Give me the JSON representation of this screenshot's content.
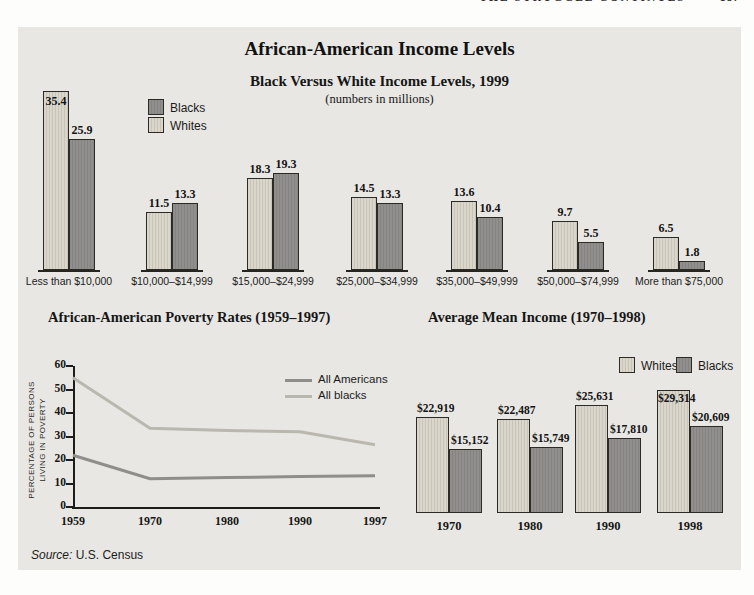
{
  "page": {
    "running_header": "THE STRUGGLE CONTINUES",
    "running_page": "187"
  },
  "panel": {
    "title": "African-American Income Levels",
    "source_label": "Source:",
    "source_text": "U.S. Census",
    "background": "#e8e7e3"
  },
  "colors": {
    "whites_bar": "#d5d1c7",
    "whites_bar_stripe": "#c8c4b8",
    "blacks_bar": "#8c8b89",
    "bar_border": "#2b2a24",
    "line_all_americans": "#8f8e8a",
    "line_all_blacks": "#bab7ae"
  },
  "chart_data": [
    {
      "type": "bar",
      "title": "Black Versus White Income Levels, 1999",
      "subtitle": "(numbers in millions)",
      "categories": [
        "Less than $10,000",
        "$10,000–$14,999",
        "$15,000–$24,999",
        "$25,000–$34,999",
        "$35,000–$49,999",
        "$50,000–$74,999",
        "More than $75,000"
      ],
      "series": [
        {
          "name": "Whites",
          "values": [
            35.4,
            11.5,
            18.3,
            14.5,
            13.6,
            9.7,
            6.5
          ]
        },
        {
          "name": "Blacks",
          "values": [
            25.9,
            13.3,
            19.3,
            13.3,
            10.4,
            5.5,
            1.8
          ]
        }
      ],
      "legend_order": [
        "Blacks",
        "Whites"
      ],
      "legend_position": "upper-left"
    },
    {
      "type": "line",
      "title": "African-American Poverty Rates (1959–1997)",
      "x": [
        "1959",
        "1970",
        "1980",
        "1990",
        "1997"
      ],
      "series": [
        {
          "name": "All Americans",
          "values": [
            22,
            12,
            12.5,
            13,
            13.3
          ]
        },
        {
          "name": "All blacks",
          "values": [
            55,
            33.5,
            32.5,
            32,
            26.5
          ]
        }
      ],
      "ylabel_line1": "PERCENTAGE OF PERSONS",
      "ylabel_line2": "LIVING IN POVERTY",
      "yticks": [
        0,
        10,
        20,
        30,
        40,
        50,
        60
      ],
      "ylim": [
        0,
        60
      ],
      "grid": false,
      "legend_position": "upper-right"
    },
    {
      "type": "bar",
      "title": "Average Mean Income (1970–1998)",
      "categories": [
        "1970",
        "1980",
        "1990",
        "1998"
      ],
      "series": [
        {
          "name": "Whites",
          "values": [
            22919,
            22487,
            25631,
            29314
          ],
          "labels": [
            "$22,919",
            "$22,487",
            "$25,631",
            "$29,314"
          ]
        },
        {
          "name": "Blacks",
          "values": [
            15152,
            15749,
            17810,
            20609
          ],
          "labels": [
            "$15,152",
            "$15,749",
            "$17,810",
            "$20,609"
          ]
        }
      ],
      "legend_order": [
        "Whites",
        "Blacks"
      ],
      "legend_position": "upper-right"
    }
  ]
}
